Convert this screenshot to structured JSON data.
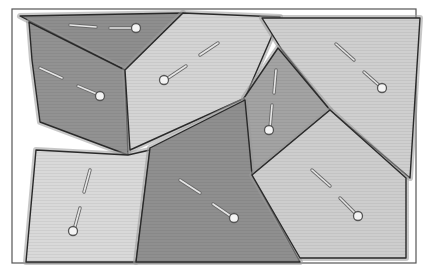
{
  "diagram": {
    "type": "voronoi-tessellation",
    "width": 430,
    "height": 270,
    "frame": {
      "x": 12,
      "y": 9,
      "w": 404,
      "h": 254,
      "stroke": "#555555"
    },
    "colors": {
      "background": "#ffffff",
      "edge": "#2a2a2a",
      "bevel": "#9a9a9a",
      "seed_fill": "#f4f4f4",
      "seed_stroke": "#555555",
      "dash_fill": "#e6e6e6",
      "dash_stroke": "#6a6a6a"
    },
    "cells": [
      {
        "id": "top-triangle",
        "fill": "#8e8e8e",
        "points": "20,16 183,13 125,70",
        "seed": {
          "x": 136,
          "y": 28
        },
        "dashes": [
          [
            70,
            25,
            96,
            27
          ],
          [
            110,
            28,
            133,
            28
          ]
        ]
      },
      {
        "id": "left-dark",
        "fill": "#929292",
        "points": "29,22 125,70 128,155 40,122 32,60",
        "seed": {
          "x": 100,
          "y": 96
        },
        "dashes": [
          [
            40,
            68,
            62,
            78
          ],
          [
            78,
            86,
            97,
            94
          ]
        ]
      },
      {
        "id": "center-light",
        "fill": "#d4d4d4",
        "points": "125,70 183,13 280,17 245,98 130,150",
        "seed": {
          "x": 164,
          "y": 80
        },
        "dashes": [
          [
            200,
            55,
            218,
            43
          ],
          [
            168,
            78,
            186,
            66
          ]
        ]
      },
      {
        "id": "top-right",
        "fill": "#cfcfcf",
        "points": "262,18 420,18 410,178 330,110 282,50",
        "seed": {
          "x": 382,
          "y": 88
        },
        "dashes": [
          [
            336,
            44,
            354,
            60
          ],
          [
            364,
            72,
            381,
            87
          ]
        ]
      },
      {
        "id": "right-mid-dark",
        "fill": "#a3a3a3",
        "points": "278,48 330,110 252,175 244,98",
        "seed": {
          "x": 269,
          "y": 130
        },
        "dashes": [
          [
            276,
            70,
            274,
            93
          ],
          [
            272,
            105,
            270,
            128
          ]
        ]
      },
      {
        "id": "left-light",
        "fill": "#d9d9d9",
        "points": "36,150 128,155 150,150 136,262 26,262",
        "seed": {
          "x": 73,
          "y": 231
        },
        "dashes": [
          [
            90,
            170,
            84,
            192
          ],
          [
            80,
            208,
            74,
            230
          ]
        ]
      },
      {
        "id": "bottom-center-dark",
        "fill": "#8f8f8f",
        "points": "150,148 245,100 252,175 300,262 136,262",
        "seed": {
          "x": 234,
          "y": 218
        },
        "dashes": [
          [
            180,
            180,
            200,
            193
          ],
          [
            213,
            204,
            232,
            217
          ]
        ]
      },
      {
        "id": "bottom-right-light",
        "fill": "#cdcdcd",
        "points": "252,175 330,110 406,178 406,258 300,258",
        "seed": {
          "x": 358,
          "y": 216
        },
        "dashes": [
          [
            312,
            170,
            330,
            186
          ],
          [
            340,
            198,
            356,
            214
          ]
        ]
      }
    ]
  }
}
